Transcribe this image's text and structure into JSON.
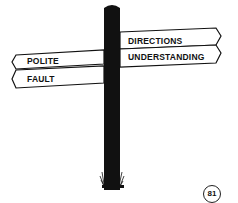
{
  "signpost": {
    "right_signs": [
      {
        "label": "DIRECTIONS"
      },
      {
        "label": "UNDERSTANDING"
      }
    ],
    "left_signs": [
      {
        "label": "POLITE"
      },
      {
        "label": "FAULT"
      }
    ]
  },
  "page_number": "81"
}
